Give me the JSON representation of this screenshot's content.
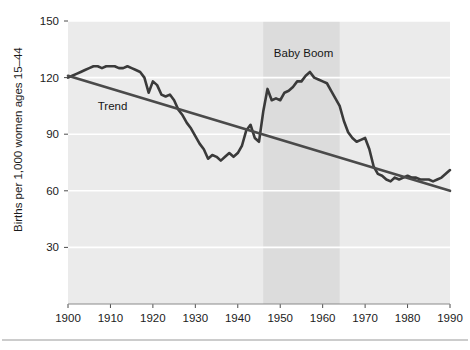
{
  "chart_data": {
    "type": "line",
    "title": "",
    "subtitle": "",
    "xlabel": "",
    "ylabel": "Births per 1,000 women ages 15–44",
    "xlim": [
      1900,
      1990
    ],
    "ylim": [
      0,
      150
    ],
    "xticks": [
      1900,
      1910,
      1920,
      1930,
      1940,
      1950,
      1960,
      1970,
      1980,
      1990
    ],
    "xticklabels": [
      "1900",
      "1910",
      "1920",
      "1930",
      "1940",
      "1950",
      "1960",
      "1970",
      "1980",
      "1990"
    ],
    "yticks": [
      30,
      60,
      90,
      120,
      150
    ],
    "yticklabels": [
      "30",
      "60",
      "90",
      "120",
      "150"
    ],
    "grid": "horizontal-white-gridlines",
    "legend": "none",
    "plot_background": "#ebebeb",
    "gridline_color": "#ffffff",
    "series": [
      {
        "name": "Birth rate",
        "label": "",
        "color": "#3a3a3a",
        "line_width": 2.6,
        "x": [
          1900,
          1901,
          1902,
          1903,
          1904,
          1905,
          1906,
          1907,
          1908,
          1909,
          1910,
          1911,
          1912,
          1913,
          1914,
          1915,
          1916,
          1917,
          1918,
          1919,
          1920,
          1921,
          1922,
          1923,
          1924,
          1925,
          1926,
          1927,
          1928,
          1929,
          1930,
          1931,
          1932,
          1933,
          1934,
          1935,
          1936,
          1937,
          1938,
          1939,
          1940,
          1941,
          1942,
          1943,
          1944,
          1945,
          1946,
          1947,
          1948,
          1949,
          1950,
          1951,
          1952,
          1953,
          1954,
          1955,
          1956,
          1957,
          1958,
          1959,
          1960,
          1961,
          1962,
          1963,
          1964,
          1965,
          1966,
          1967,
          1968,
          1969,
          1970,
          1971,
          1972,
          1973,
          1974,
          1975,
          1976,
          1977,
          1978,
          1979,
          1980,
          1981,
          1982,
          1983,
          1984,
          1985,
          1986,
          1987,
          1988,
          1989,
          1990
        ],
        "y": [
          120,
          121,
          122,
          123,
          124,
          125,
          126,
          126,
          125,
          126,
          126,
          126,
          125,
          125,
          126,
          125,
          124,
          123,
          120,
          112,
          118,
          116,
          111,
          110,
          111,
          108,
          103,
          100,
          96,
          93,
          89,
          85,
          82,
          77,
          79,
          78,
          76,
          78,
          80,
          78,
          80,
          84,
          92,
          95,
          88,
          86,
          102,
          114,
          108,
          109,
          108,
          112,
          113,
          115,
          118,
          118,
          121,
          123,
          120,
          119,
          118,
          117,
          113,
          109,
          105,
          97,
          91,
          88,
          86,
          87,
          88,
          82,
          73,
          69,
          68,
          66,
          65,
          67,
          66,
          67,
          68,
          67,
          67,
          66,
          66,
          66,
          65,
          66,
          67,
          69,
          71
        ]
      },
      {
        "name": "Trend",
        "label": "Trend",
        "color": "#4a4a4a",
        "line_width": 2.6,
        "x": [
          1900,
          1990
        ],
        "y": [
          121,
          60
        ]
      }
    ],
    "annotations": [
      {
        "text": "Trend",
        "x": 1910.5,
        "y": 103,
        "name": "trend-label"
      },
      {
        "text": "Baby Boom",
        "x": 1955.5,
        "y": 131,
        "name": "baby-boom-label"
      }
    ],
    "shaded_regions": [
      {
        "name": "baby-boom-band",
        "label": "Baby Boom",
        "x_start": 1946,
        "x_end": 1964,
        "color": "#dcdcdc"
      }
    ]
  }
}
